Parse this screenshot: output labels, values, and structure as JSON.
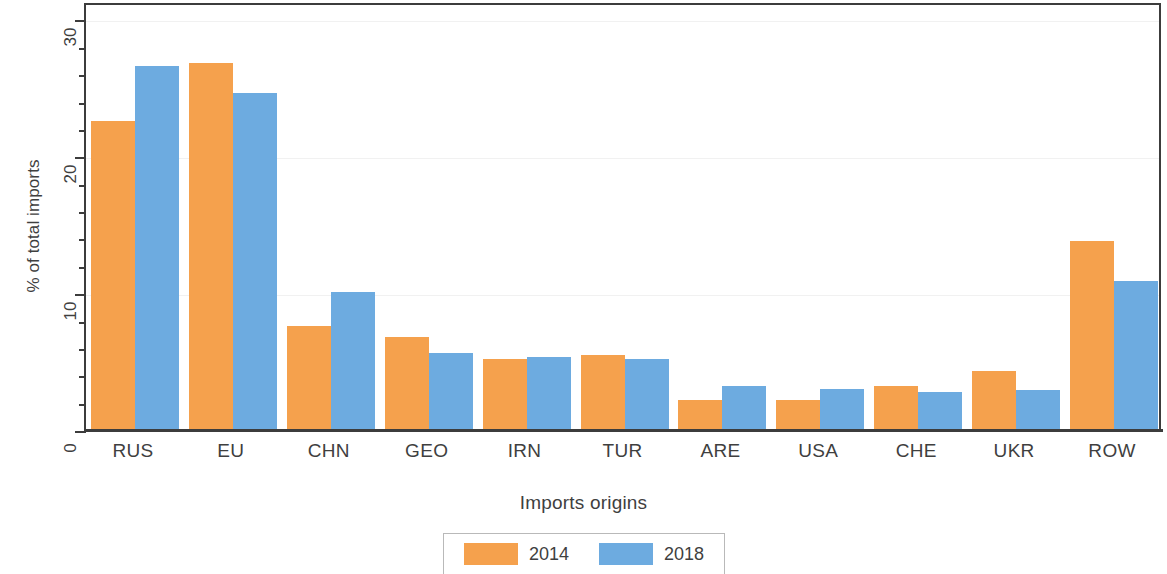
{
  "chart_data": {
    "type": "bar",
    "title": "",
    "xlabel": "Imports origins",
    "ylabel": "% of total imports",
    "categories": [
      "RUS",
      "EU",
      "CHN",
      "GEO",
      "IRN",
      "TUR",
      "ARE",
      "USA",
      "CHE",
      "UKR",
      "ROW"
    ],
    "series": [
      {
        "name": "2014",
        "color": "#f5a14d",
        "values": [
          22.6,
          26.8,
          7.6,
          6.8,
          5.2,
          5.5,
          2.2,
          2.2,
          3.2,
          4.3,
          13.8
        ]
      },
      {
        "name": "2018",
        "color": "#6dabe0",
        "values": [
          26.6,
          24.6,
          10.1,
          5.6,
          5.3,
          5.2,
          3.2,
          3.0,
          2.8,
          2.9,
          10.9
        ]
      }
    ],
    "ylim": [
      0,
      31.2
    ],
    "ytick_labels": [
      "0",
      "10",
      "20",
      "30"
    ],
    "ytick_values": [
      0,
      10,
      20,
      30
    ],
    "yminor_values": [
      2,
      4,
      6,
      8,
      12,
      14,
      16,
      18,
      22,
      24,
      26,
      28
    ],
    "grid": "horizontal-major",
    "legend_position": "bottom-center",
    "legend_entries": [
      "2014",
      "2018"
    ]
  }
}
